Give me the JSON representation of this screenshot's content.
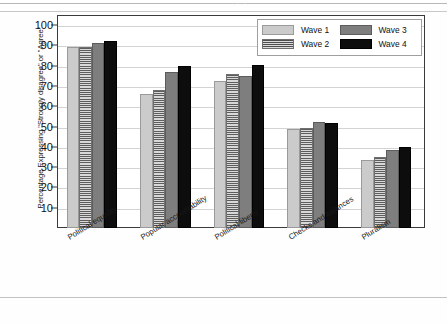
{
  "artifacts": {
    "ghost_text": "· ·"
  },
  "legend": {
    "position": "top-right",
    "entries": [
      {
        "label": "Wave 1",
        "pattern": "solid-light-gray",
        "color": "#cbcbcb"
      },
      {
        "label": "Wave 2",
        "pattern": "horizontal-stripes",
        "color": "#b4b4b4"
      },
      {
        "label": "Wave 3",
        "pattern": "solid-medium-gray",
        "color": "#7e7e7e"
      },
      {
        "label": "Wave 4",
        "pattern": "solid-black",
        "color": "#0d0d0d"
      }
    ]
  },
  "chart_data": {
    "type": "bar",
    "title": "",
    "xlabel": "",
    "ylabel": "Percentage Expressing \"Strongly disagree\" or \"Agree\"",
    "ylim": [
      0,
      105
    ],
    "yticks": [
      10,
      20,
      30,
      40,
      50,
      60,
      70,
      80,
      90,
      100
    ],
    "grid": true,
    "legend_position": "top-right",
    "categories": [
      "Political equality",
      "Popular accountability",
      "Political liberty",
      "Checks and balances",
      "Pluralism"
    ],
    "series": [
      {
        "name": "Wave 1",
        "values": [
          89,
          66,
          72.5,
          49,
          33.5
        ]
      },
      {
        "name": "Wave 2",
        "values": [
          89,
          68,
          76,
          49.5,
          35
        ]
      },
      {
        "name": "Wave 3",
        "values": [
          91,
          77,
          75,
          52.5,
          38.5
        ]
      },
      {
        "name": "Wave 4",
        "values": [
          92,
          80,
          80.5,
          52,
          40
        ]
      }
    ]
  }
}
